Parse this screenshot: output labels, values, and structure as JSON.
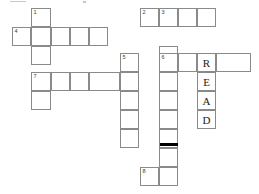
{
  "puzzle": {
    "type": "crossword-grid",
    "cell_size": 19,
    "grid_origin": {
      "x": 12,
      "y": 8
    },
    "border_color": "#8a8a8a",
    "background_color": "#ffffff",
    "letter_color": "#1a1a1a",
    "number_color": "#3a3a3a",
    "block_color": "#000000",
    "clue_numbers": [
      "1",
      "2",
      "3",
      "4",
      "5",
      "6",
      "7",
      "8"
    ],
    "filled_answer": "READ",
    "filled_answer_direction": "down",
    "cells": [
      {
        "name": "cell-r0c1",
        "x": 31,
        "y": 8,
        "w": 20,
        "h": 19,
        "number": "1",
        "letter": ""
      },
      {
        "name": "cell-r0c7",
        "x": 140,
        "y": 8,
        "w": 19,
        "h": 19,
        "number": "2",
        "letter": ""
      },
      {
        "name": "cell-r0c8",
        "x": 159,
        "y": 8,
        "w": 19,
        "h": 19,
        "number": "3",
        "letter": ""
      },
      {
        "name": "cell-r0c9",
        "x": 178,
        "y": 8,
        "w": 19,
        "h": 19,
        "number": "",
        "letter": ""
      },
      {
        "name": "cell-r0c10",
        "x": 197,
        "y": 8,
        "w": 19,
        "h": 19,
        "number": "",
        "letter": ""
      },
      {
        "name": "cell-r1c0",
        "x": 12,
        "y": 27,
        "w": 19,
        "h": 19,
        "number": "4",
        "letter": ""
      },
      {
        "name": "cell-r1c1",
        "x": 31,
        "y": 27,
        "w": 20,
        "h": 19,
        "number": "",
        "letter": ""
      },
      {
        "name": "cell-r1c2",
        "x": 51,
        "y": 27,
        "w": 19,
        "h": 19,
        "number": "",
        "letter": ""
      },
      {
        "name": "cell-r1c3",
        "x": 70,
        "y": 27,
        "w": 19,
        "h": 19,
        "number": "",
        "letter": ""
      },
      {
        "name": "cell-r1c4",
        "x": 89,
        "y": 27,
        "w": 19,
        "h": 19,
        "number": "",
        "letter": ""
      },
      {
        "name": "cell-r2c1",
        "x": 31,
        "y": 46,
        "w": 20,
        "h": 19,
        "number": "",
        "letter": ""
      },
      {
        "name": "cell-r2c8",
        "x": 159,
        "y": 46,
        "w": 19,
        "h": 19,
        "number": "",
        "letter": ""
      },
      {
        "name": "cell-r3c5",
        "x": 120,
        "y": 53,
        "w": 19,
        "h": 19,
        "number": "5",
        "letter": ""
      },
      {
        "name": "cell-r3c8",
        "x": 159,
        "y": 53,
        "w": 19,
        "h": 19,
        "number": "6",
        "letter": ""
      },
      {
        "name": "cell-r3c9",
        "x": 178,
        "y": 53,
        "w": 19,
        "h": 19,
        "number": "",
        "letter": ""
      },
      {
        "name": "cell-r3c10",
        "x": 197,
        "y": 53,
        "w": 19,
        "h": 19,
        "number": "",
        "letter": "R"
      },
      {
        "name": "cell-r3c11",
        "x": 216,
        "y": 53,
        "w": 35,
        "h": 19,
        "number": "",
        "letter": ""
      },
      {
        "name": "cell-r4c1",
        "x": 31,
        "y": 72,
        "w": 20,
        "h": 19,
        "number": "7",
        "letter": ""
      },
      {
        "name": "cell-r4c2",
        "x": 51,
        "y": 72,
        "w": 19,
        "h": 19,
        "number": "",
        "letter": ""
      },
      {
        "name": "cell-r4c3",
        "x": 70,
        "y": 72,
        "w": 19,
        "h": 19,
        "number": "",
        "letter": ""
      },
      {
        "name": "cell-r4c4",
        "x": 89,
        "y": 72,
        "w": 31,
        "h": 19,
        "number": "",
        "letter": ""
      },
      {
        "name": "cell-r4c5",
        "x": 120,
        "y": 72,
        "w": 19,
        "h": 19,
        "number": "",
        "letter": ""
      },
      {
        "name": "cell-r4c8",
        "x": 159,
        "y": 72,
        "w": 19,
        "h": 19,
        "number": "",
        "letter": ""
      },
      {
        "name": "cell-r4c10",
        "x": 197,
        "y": 72,
        "w": 19,
        "h": 19,
        "number": "",
        "letter": "E"
      },
      {
        "name": "cell-r5c1",
        "x": 31,
        "y": 91,
        "w": 20,
        "h": 19,
        "number": "",
        "letter": ""
      },
      {
        "name": "cell-r5c5",
        "x": 120,
        "y": 91,
        "w": 19,
        "h": 19,
        "number": "",
        "letter": ""
      },
      {
        "name": "cell-r5c8",
        "x": 159,
        "y": 91,
        "w": 19,
        "h": 19,
        "number": "",
        "letter": ""
      },
      {
        "name": "cell-r5c10",
        "x": 197,
        "y": 91,
        "w": 19,
        "h": 19,
        "number": "",
        "letter": "A"
      },
      {
        "name": "cell-r6c5",
        "x": 120,
        "y": 110,
        "w": 19,
        "h": 19,
        "number": "",
        "letter": ""
      },
      {
        "name": "cell-r6c8",
        "x": 159,
        "y": 110,
        "w": 19,
        "h": 19,
        "number": "",
        "letter": ""
      },
      {
        "name": "cell-r6c10",
        "x": 197,
        "y": 110,
        "w": 19,
        "h": 19,
        "number": "",
        "letter": "D"
      },
      {
        "name": "cell-r7c5",
        "x": 120,
        "y": 129,
        "w": 19,
        "h": 19,
        "number": "",
        "letter": ""
      },
      {
        "name": "cell-r7c8",
        "x": 159,
        "y": 129,
        "w": 19,
        "h": 19,
        "number": "",
        "letter": ""
      },
      {
        "name": "cell-r8c8",
        "x": 159,
        "y": 148,
        "w": 19,
        "h": 19,
        "number": "",
        "letter": ""
      },
      {
        "name": "cell-r9c7",
        "x": 140,
        "y": 167,
        "w": 19,
        "h": 19,
        "number": "8",
        "letter": ""
      },
      {
        "name": "cell-r9c8",
        "x": 159,
        "y": 167,
        "w": 19,
        "h": 19,
        "number": "",
        "letter": ""
      }
    ],
    "blocks": [
      {
        "name": "block-bar",
        "x": 160,
        "y": 143,
        "w": 18,
        "h": 3
      }
    ],
    "specks": [
      {
        "name": "artifact-speck-left",
        "x": 10,
        "y": 1,
        "w": 16,
        "h": 1
      },
      {
        "name": "artifact-speck-right",
        "x": 83,
        "y": 1,
        "w": 3,
        "h": 2
      }
    ]
  }
}
